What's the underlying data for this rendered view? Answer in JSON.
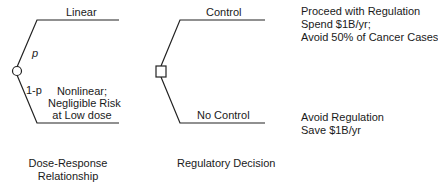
{
  "chance_node": {
    "branches": [
      {
        "label": "Linear",
        "probability": "p"
      },
      {
        "label_lines": [
          "Nonlinear;",
          "Negligible Risk",
          "at Low dose"
        ],
        "probability": "1-p"
      }
    ]
  },
  "decision_node": {
    "branches": [
      {
        "label": "Control"
      },
      {
        "label": "No Control"
      }
    ]
  },
  "outcomes": [
    {
      "lines": [
        "Proceed with Regulation",
        "Spend $1B/yr;",
        "Avoid 50% of Cancer Cases"
      ]
    },
    {
      "lines": [
        "Avoid Regulation",
        "Save $1B/yr"
      ]
    }
  ],
  "captions": {
    "dose_response": [
      "Dose-Response",
      "Relationship"
    ],
    "regulatory": "Regulatory Decision"
  },
  "colors": {
    "line": "#222222",
    "background": "#ffffff"
  }
}
